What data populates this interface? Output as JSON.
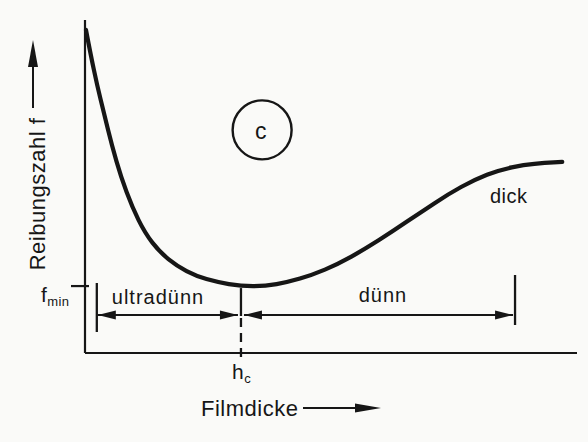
{
  "chart_data": {
    "type": "line",
    "title": "",
    "xlabel": "Filmdicke",
    "ylabel": "Reibungszahl f",
    "x_axis": {
      "quantitative": false,
      "ticks": [],
      "arrow": true
    },
    "y_axis": {
      "quantitative": false,
      "ticks": [],
      "arrow": true
    },
    "grid": false,
    "legend": false,
    "series": [
      {
        "name": "Reibungszahl f als Funktion der Filmdicke",
        "x": [
          0.002,
          0.012,
          0.024,
          0.039,
          0.055,
          0.073,
          0.096,
          0.122,
          0.152,
          0.187,
          0.226,
          0.268,
          0.317,
          0.366,
          0.413,
          0.461,
          0.514,
          0.569,
          0.626,
          0.683,
          0.738,
          0.791,
          0.843,
          0.892,
          0.935,
          0.97
        ],
        "f": [
          0.97,
          0.892,
          0.808,
          0.718,
          0.622,
          0.529,
          0.438,
          0.36,
          0.303,
          0.261,
          0.231,
          0.213,
          0.201,
          0.201,
          0.213,
          0.234,
          0.267,
          0.312,
          0.366,
          0.423,
          0.477,
          0.52,
          0.55,
          0.565,
          0.571,
          0.574
        ]
      }
    ],
    "annotations": {
      "f_min": {
        "text": "f",
        "sub": "min",
        "f_norm": 0.201
      },
      "h_c": {
        "text": "h",
        "sub": "c",
        "x_norm": 0.317
      },
      "regions": [
        {
          "label": "ultradünn",
          "from_x": 0.024,
          "to_x": 0.317
        },
        {
          "label": "dünn",
          "from_x": 0.317,
          "to_x": 0.87
        }
      ],
      "thick_label": {
        "text": "dick",
        "x_norm": 0.825,
        "f_norm": 0.47
      },
      "circle_marker": {
        "text": "c",
        "x_norm": 0.36,
        "f_norm": 0.67,
        "radius_px": 29.5
      }
    }
  }
}
